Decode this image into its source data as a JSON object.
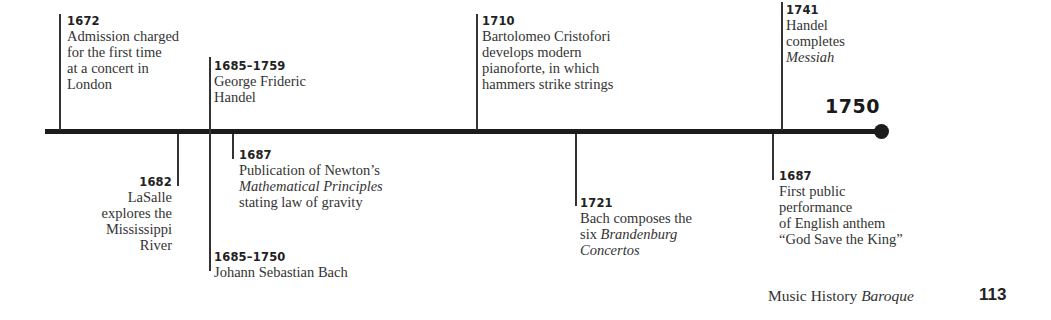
{
  "timeline": {
    "end_year": "1750",
    "events": [
      {
        "id": "e1672",
        "year": "1672",
        "text": "Admission charged\nfor the first time\nat a concert in\nLondon"
      },
      {
        "id": "e1685h",
        "year": "1685–1759",
        "text": "George Frideric\nHandel"
      },
      {
        "id": "e1710",
        "year": "1710",
        "text": "Bartolomeo Cristofori\ndevelops modern\npianoforte, in which\nhammers strike strings"
      },
      {
        "id": "e1741",
        "year": "1741",
        "text_lines": [
          "Handel",
          "completes"
        ],
        "italic": "Messiah"
      },
      {
        "id": "e1682",
        "year": "1682",
        "text": "LaSalle\nexplores the\nMississippi\nRiver"
      },
      {
        "id": "e1687n",
        "year": "1687",
        "line1": "Publication of Newton’s",
        "italic": "Mathematical Principles",
        "line3": "stating law of gravity"
      },
      {
        "id": "e1685b",
        "year": "1685–1750",
        "text": "Johann Sebastian Bach"
      },
      {
        "id": "e1721",
        "year": "1721",
        "line1": "Bach composes the",
        "line2_prefix": "six ",
        "italic": "Brandenburg",
        "italic2": "Concertos"
      },
      {
        "id": "e1687a",
        "year": "1687",
        "text": "First public\nperformance\nof English anthem\n“God Save the King”"
      }
    ]
  },
  "footer": {
    "book": "Music History",
    "section": "Baroque",
    "page_number": "113"
  },
  "colors": {
    "line": "#1c1c1c",
    "text": "#333333"
  }
}
